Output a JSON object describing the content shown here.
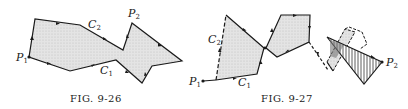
{
  "figures": [
    {
      "id": "fig-9-26",
      "caption": "FIG. 9-26",
      "labels": {
        "p1": "P",
        "p1_sub": "1",
        "p2": "P",
        "p2_sub": "2",
        "c1": "C",
        "c1_sub": "1",
        "c2": "C",
        "c2_sub": "2"
      }
    },
    {
      "id": "fig-9-27",
      "caption": "FIG. 9-27",
      "labels": {
        "p1": "P",
        "p1_sub": "1",
        "p2": "P",
        "p2_sub": "2",
        "c1": "C",
        "c1_sub": "1",
        "c2": "C",
        "c2_sub": "2"
      }
    }
  ],
  "colors": {
    "stroke": "#1a1a1a",
    "fill": "#dcdcdc",
    "background": "#ffffff"
  }
}
